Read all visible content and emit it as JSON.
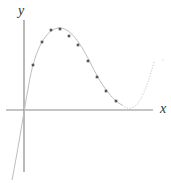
{
  "diagram": {
    "type": "function-plot",
    "axes": {
      "x_label": "x",
      "y_label": "y",
      "axis_color": "#8a8a8a"
    },
    "curve": {
      "description": "cubic curve: rises steeply from below, peaks, descends to a local minimum near the x-axis, then rises again",
      "solid_color": "#bdbdbd",
      "dotted_color": "#c8c8c8"
    },
    "points_color": "#555555",
    "points": [
      {
        "px": 33,
        "py": 65
      },
      {
        "px": 42,
        "py": 42
      },
      {
        "px": 51,
        "py": 30
      },
      {
        "px": 60,
        "py": 29
      },
      {
        "px": 69,
        "py": 36
      },
      {
        "px": 78,
        "py": 45
      },
      {
        "px": 88,
        "py": 61
      },
      {
        "px": 97,
        "py": 77
      },
      {
        "px": 106,
        "py": 91
      },
      {
        "px": 116,
        "py": 101
      }
    ]
  }
}
